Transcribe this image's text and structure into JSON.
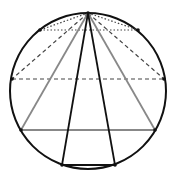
{
  "diagram": {
    "type": "circle-inscribed-triangles",
    "width": 178,
    "height": 184,
    "circle": {
      "cx": 88,
      "cy": 91,
      "r": 78,
      "stroke": "#111111",
      "stroke_width": 2
    },
    "apex": {
      "x": 88,
      "y": 13
    },
    "triangles": [
      {
        "name": "dotted-triangle",
        "points": [
          [
            40,
            30
          ],
          [
            138,
            30
          ]
        ],
        "style": "dotted",
        "color": "#444444"
      },
      {
        "name": "dashed-triangle",
        "points": [
          [
            12,
            79
          ],
          [
            164,
            79
          ]
        ],
        "style": "dashed",
        "color": "#444444"
      },
      {
        "name": "gray-triangle",
        "points": [
          [
            21,
            130
          ],
          [
            155,
            130
          ]
        ],
        "style": "solid",
        "color": "#888888"
      },
      {
        "name": "black-triangle",
        "points": [
          [
            62,
            165
          ],
          [
            115,
            165
          ]
        ],
        "style": "solid",
        "color": "#111111"
      }
    ],
    "colors": {
      "background": "#ffffff",
      "circle": "#111111",
      "gray": "#888888",
      "dark": "#444444"
    }
  }
}
